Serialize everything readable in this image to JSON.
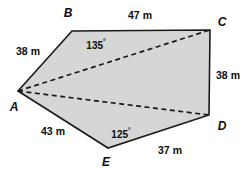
{
  "figure": {
    "shape_name": "pentagon-abcde",
    "fill_color": "#d6d6d6",
    "stroke_color": "#1a1a1a",
    "dashed_color": "#1a1a1a",
    "background_color": "#ffffff",
    "outline_points": "18,91 72,31 210,30 209,115 108,148",
    "diagonals": [
      {
        "name": "diagonal-a-c",
        "x1": 18,
        "y1": 91,
        "x2": 210,
        "y2": 30
      },
      {
        "name": "diagonal-a-d",
        "x1": 18,
        "y1": 91,
        "x2": 209,
        "y2": 115
      }
    ],
    "vertices": [
      {
        "id": "A",
        "label": "A",
        "x": 18,
        "y": 91,
        "label_x": 14,
        "label_y": 107
      },
      {
        "id": "B",
        "label": "B",
        "x": 72,
        "y": 31,
        "label_x": 68,
        "label_y": 13
      },
      {
        "id": "C",
        "label": "C",
        "x": 210,
        "y": 30,
        "label_x": 222,
        "label_y": 22
      },
      {
        "id": "D",
        "label": "D",
        "x": 209,
        "y": 115,
        "label_x": 222,
        "label_y": 126
      },
      {
        "id": "E",
        "label": "E",
        "x": 108,
        "y": 148,
        "label_x": 106,
        "label_y": 162
      }
    ],
    "side_labels": [
      {
        "name": "side-label-ab",
        "text": "38 m",
        "x": 28,
        "y": 51
      },
      {
        "name": "side-label-bc",
        "text": "47 m",
        "x": 140,
        "y": 15
      },
      {
        "name": "side-label-cd",
        "text": "38 m",
        "x": 228,
        "y": 75
      },
      {
        "name": "side-label-de",
        "text": "37 m",
        "x": 170,
        "y": 150
      },
      {
        "name": "side-label-ea",
        "text": "43 m",
        "x": 53,
        "y": 131
      }
    ],
    "angle_labels": [
      {
        "name": "angle-label-b",
        "value": "135",
        "degree_symbol": "°",
        "x": 96,
        "y": 45
      },
      {
        "name": "angle-label-e",
        "value": "125",
        "degree_symbol": "°",
        "x": 121,
        "y": 134
      }
    ]
  }
}
